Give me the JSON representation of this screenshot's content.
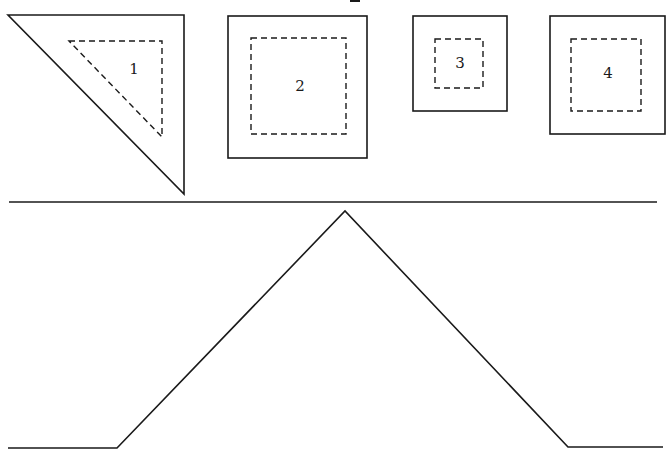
{
  "diagram": {
    "colors": {
      "stroke": "#1a1a1a",
      "background": "#ffffff"
    },
    "top_fragment": {
      "note": "cropped glyph fragment at top edge"
    },
    "shapes": [
      {
        "id": 1,
        "label": "1",
        "type": "triangle",
        "outer": [
          [
            8,
            15
          ],
          [
            184,
            15
          ],
          [
            184,
            194
          ]
        ],
        "inner_dashed": [
          [
            69,
            41
          ],
          [
            162,
            41
          ],
          [
            162,
            137
          ]
        ],
        "label_pos": [
          134,
          70
        ]
      },
      {
        "id": 2,
        "label": "2",
        "type": "square",
        "outer": [
          228,
          16,
          367,
          158
        ],
        "inner_dashed": [
          251,
          38,
          346,
          134
        ],
        "label_pos": [
          300,
          87
        ]
      },
      {
        "id": 3,
        "label": "3",
        "type": "square",
        "outer": [
          413,
          16,
          507,
          111
        ],
        "inner_dashed": [
          435,
          39,
          483,
          88
        ],
        "label_pos": [
          460,
          64
        ]
      },
      {
        "id": 4,
        "label": "4",
        "type": "square",
        "outer": [
          550,
          16,
          665,
          134
        ],
        "inner_dashed": [
          571,
          39,
          641,
          111
        ],
        "label_pos": [
          608,
          74
        ]
      }
    ],
    "divider": {
      "x1": 9,
      "y1": 202,
      "x2": 657,
      "y2": 202
    },
    "profile": {
      "points": [
        [
          8,
          448
        ],
        [
          117,
          448
        ],
        [
          345,
          211
        ],
        [
          568,
          447
        ],
        [
          663,
          447
        ]
      ]
    }
  }
}
